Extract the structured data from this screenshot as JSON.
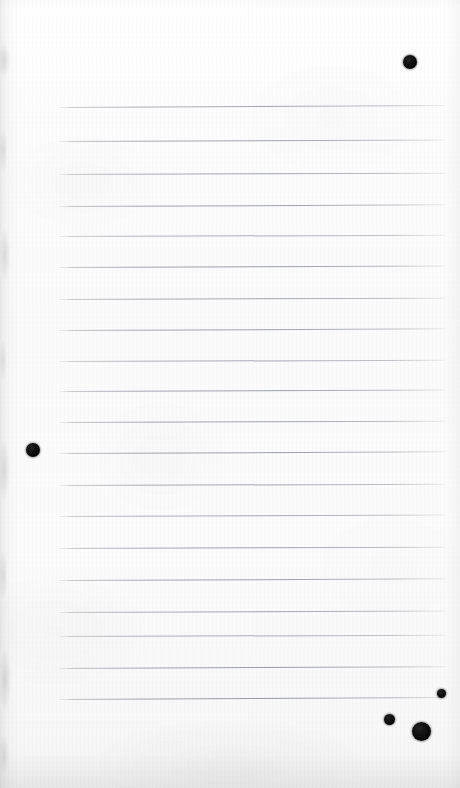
{
  "document": {
    "kind": "scanned-notebook-page",
    "title": "Blank ruled notebook page (scan)",
    "caption": "",
    "page_width": 460,
    "page_height": 788,
    "paper_color": "#fbfbfb",
    "rule_color": "#6a6f7a",
    "ink_color": "#0d0d0d",
    "text_content": "",
    "handwriting": "",
    "printed_text": ""
  },
  "paper": {
    "left_edge_style": "torn-shadowed",
    "bottom_edge_style": "soft-gray-shadow",
    "background_start": "#ffffff",
    "background_end": "#f3f3f3"
  },
  "ruling": {
    "line_count": 19,
    "first_line_y": 107,
    "spacing": 32.9,
    "left_x": 57,
    "right_x": 448,
    "lines": [
      {
        "label": "rule-1",
        "y": 107,
        "x1": 57,
        "x2": 448,
        "tilt": -0.3,
        "opacity": 0.7
      },
      {
        "label": "rule-2",
        "y": 141,
        "x1": 57,
        "x2": 448,
        "tilt": -0.22,
        "opacity": 0.74
      },
      {
        "label": "rule-3",
        "y": 174,
        "x1": 57,
        "x2": 448,
        "tilt": -0.2,
        "opacity": 0.72
      },
      {
        "label": "rule-4",
        "y": 206,
        "x1": 57,
        "x2": 448,
        "tilt": -0.24,
        "opacity": 0.76
      },
      {
        "label": "rule-5",
        "y": 236,
        "x1": 57,
        "x2": 448,
        "tilt": -0.18,
        "opacity": 0.66
      },
      {
        "label": "rule-6",
        "y": 267,
        "x1": 57,
        "x2": 448,
        "tilt": -0.22,
        "opacity": 0.78
      },
      {
        "label": "rule-7",
        "y": 299,
        "x1": 57,
        "x2": 448,
        "tilt": -0.2,
        "opacity": 0.72
      },
      {
        "label": "rule-8",
        "y": 330,
        "x1": 57,
        "x2": 448,
        "tilt": -0.24,
        "opacity": 0.75
      },
      {
        "label": "rule-9",
        "y": 361,
        "x1": 57,
        "x2": 448,
        "tilt": -0.18,
        "opacity": 0.68
      },
      {
        "label": "rule-10",
        "y": 391,
        "x1": 57,
        "x2": 448,
        "tilt": -0.22,
        "opacity": 0.76
      },
      {
        "label": "rule-11",
        "y": 422,
        "x1": 57,
        "x2": 448,
        "tilt": -0.2,
        "opacity": 0.74
      },
      {
        "label": "rule-12",
        "y": 453,
        "x1": 57,
        "x2": 448,
        "tilt": -0.24,
        "opacity": 0.78
      },
      {
        "label": "rule-13",
        "y": 485,
        "x1": 57,
        "x2": 448,
        "tilt": -0.18,
        "opacity": 0.72
      },
      {
        "label": "rule-14",
        "y": 516,
        "x1": 57,
        "x2": 448,
        "tilt": -0.22,
        "opacity": 0.7
      },
      {
        "label": "rule-15",
        "y": 548,
        "x1": 57,
        "x2": 448,
        "tilt": -0.2,
        "opacity": 0.74
      },
      {
        "label": "rule-16",
        "y": 580,
        "x1": 57,
        "x2": 448,
        "tilt": -0.24,
        "opacity": 0.76
      },
      {
        "label": "rule-17",
        "y": 612,
        "x1": 57,
        "x2": 448,
        "tilt": -0.22,
        "opacity": 0.72
      },
      {
        "label": "rule-18",
        "y": 636,
        "x1": 57,
        "x2": 448,
        "tilt": -0.18,
        "opacity": 0.68
      },
      {
        "label": "rule-19",
        "y": 668,
        "x1": 57,
        "x2": 448,
        "tilt": -0.26,
        "opacity": 0.78
      },
      {
        "label": "rule-20",
        "y": 699,
        "x1": 57,
        "x2": 448,
        "tilt": -0.3,
        "opacity": 0.8
      }
    ]
  },
  "ink_marks": [
    {
      "label": "ink-dot-top-right",
      "cx": 410,
      "cy": 62,
      "d": 14
    },
    {
      "label": "ink-dot-left-margin",
      "cx": 33,
      "cy": 450,
      "d": 14
    },
    {
      "label": "ink-dot-bottom-small",
      "cx": 441,
      "cy": 693,
      "d": 9
    },
    {
      "label": "ink-dot-bottom-mid",
      "cx": 389,
      "cy": 719,
      "d": 11
    },
    {
      "label": "ink-dot-bottom-large",
      "cx": 421,
      "cy": 731,
      "d": 19
    }
  ]
}
